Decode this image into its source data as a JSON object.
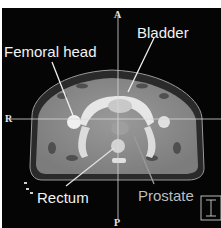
{
  "image": {
    "description": "Axial pelvic CT slice with anatomical labels",
    "orientation_markers": {
      "anterior": "A",
      "posterior": "P",
      "right": "R"
    },
    "labels": [
      {
        "id": "femoral-head",
        "text": "Femoral head"
      },
      {
        "id": "bladder",
        "text": "Bladder"
      },
      {
        "id": "rectum",
        "text": "Rectum"
      },
      {
        "id": "prostate",
        "text": "Prostate"
      }
    ],
    "scale_icon": "I-beam-scale-icon"
  },
  "colors": {
    "background": "#050505",
    "label_white": "#f2f2f2",
    "label_gray": "#bdbdbd",
    "crosshair": "#d8d8d8",
    "soft_tissue": "#8a8a8a",
    "bone": "#eeeeee"
  }
}
